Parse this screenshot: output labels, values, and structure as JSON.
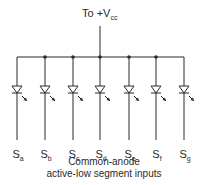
{
  "supply": {
    "prefix": "To +V",
    "subscript": "cc"
  },
  "segments": [
    {
      "letter": "S",
      "sub": "a"
    },
    {
      "letter": "S",
      "sub": "b"
    },
    {
      "letter": "S",
      "sub": "c"
    },
    {
      "letter": "S",
      "sub": "d"
    },
    {
      "letter": "S",
      "sub": "e"
    },
    {
      "letter": "S",
      "sub": "f"
    },
    {
      "letter": "S",
      "sub": "g"
    }
  ],
  "caption": {
    "line1": "Common-anode",
    "line2": "active-low segment inputs"
  },
  "colors": {
    "line": "#2a2a2a"
  }
}
